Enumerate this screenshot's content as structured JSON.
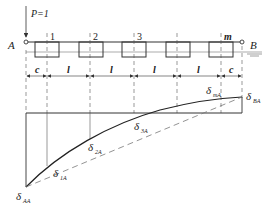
{
  "figure": {
    "load_label": "P=1",
    "support_left": "A",
    "support_right": "B",
    "points": [
      "1",
      "2",
      "3",
      "m"
    ],
    "dimensions": [
      "c",
      "l",
      "l",
      "l",
      "l",
      "c"
    ],
    "deflection_labels": {
      "AA": {
        "main": "δ",
        "sub": "AA"
      },
      "1A": {
        "main": "δ",
        "sub": "1A"
      },
      "2A": {
        "main": "δ",
        "sub": "2A"
      },
      "3A": {
        "main": "δ",
        "sub": "3A"
      },
      "mA": {
        "main": "δ",
        "sub": "mA"
      },
      "BA": {
        "main": "δ",
        "sub": "BA"
      }
    },
    "line_color": "#333333",
    "dash_color": "#777777"
  }
}
